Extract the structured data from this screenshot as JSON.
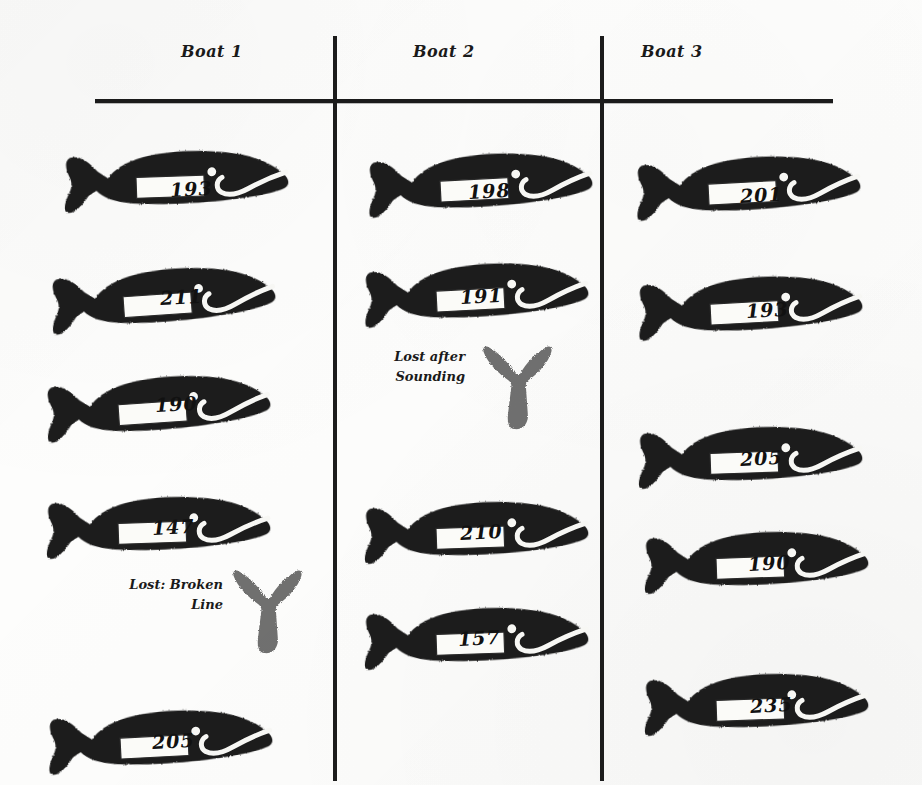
{
  "document": {
    "title": "Whaling logbook page — whale stamps by boat",
    "ink_color": "#1b1b1b",
    "paper_color": "#fdfdfc"
  },
  "columns": [
    {
      "header": "Boat 1",
      "entries": [
        {
          "kind": "whale",
          "number": "193"
        },
        {
          "kind": "whale",
          "number": "211"
        },
        {
          "kind": "whale",
          "number": "190"
        },
        {
          "kind": "whale",
          "number": "147"
        },
        {
          "kind": "lost",
          "note": "Lost: Broken\nLine"
        },
        {
          "kind": "whale",
          "number": "205"
        }
      ]
    },
    {
      "header": "Boat 2",
      "entries": [
        {
          "kind": "whale",
          "number": "198"
        },
        {
          "kind": "whale",
          "number": "191"
        },
        {
          "kind": "lost",
          "note": "Lost after\nSounding"
        },
        {
          "kind": "whale",
          "number": "210"
        },
        {
          "kind": "whale",
          "number": "157"
        }
      ]
    },
    {
      "header": "Boat 3",
      "entries": [
        {
          "kind": "whale",
          "number": "201"
        },
        {
          "kind": "whale",
          "number": "193"
        },
        {
          "kind": "whale",
          "number": "205"
        },
        {
          "kind": "whale",
          "number": "190"
        },
        {
          "kind": "whale",
          "number": "235"
        }
      ]
    }
  ],
  "icons": {
    "whale": "whale-stamp-icon",
    "tail": "whale-tail-stamp-icon"
  }
}
